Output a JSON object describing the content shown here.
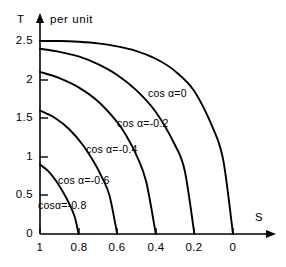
{
  "chart_data": {
    "type": "line",
    "title": "",
    "xlabel": "S",
    "ylabel": "T",
    "ylabel_unit": "per unit",
    "xlim": [
      1,
      0
    ],
    "ylim": [
      0,
      2.5
    ],
    "x_ticks": [
      "1",
      "0.8",
      "0.6",
      "0.4",
      "0.2",
      "0"
    ],
    "x_tick_values": [
      1,
      0.8,
      0.6,
      0.4,
      0.2,
      0
    ],
    "y_ticks": [
      "2.5",
      "2",
      "1.5",
      "1",
      "0.5",
      "0"
    ],
    "y_tick_values": [
      2.5,
      2,
      1.5,
      1,
      0.5,
      0
    ],
    "grid": false,
    "legend_position": "inline-annotations",
    "axis_direction_note": "x axis decreasing left to right",
    "series": [
      {
        "name": "cos α=0",
        "label": "cos α=0",
        "x": [
          1.0,
          0.9,
          0.8,
          0.7,
          0.6,
          0.5,
          0.4,
          0.3,
          0.2,
          0.1,
          0.05,
          0.0
        ],
        "values": [
          2.5,
          2.5,
          2.49,
          2.47,
          2.43,
          2.37,
          2.27,
          2.11,
          1.85,
          1.35,
          0.95,
          0.0
        ]
      },
      {
        "name": "cos α=-0.2",
        "label": "cos α=-0.2",
        "x": [
          1.0,
          0.9,
          0.8,
          0.7,
          0.6,
          0.5,
          0.4,
          0.3,
          0.25,
          0.2
        ],
        "values": [
          2.4,
          2.36,
          2.3,
          2.2,
          2.06,
          1.86,
          1.58,
          1.15,
          0.82,
          0.0
        ]
      },
      {
        "name": "cos α=-0.4",
        "label": "cos α=-0.4",
        "x": [
          1.0,
          0.9,
          0.8,
          0.7,
          0.6,
          0.55,
          0.5,
          0.45,
          0.4
        ],
        "values": [
          2.1,
          2.02,
          1.9,
          1.72,
          1.45,
          1.26,
          1.02,
          0.68,
          0.0
        ]
      },
      {
        "name": "cos α=-0.6",
        "label": "cos α=-0.6",
        "x": [
          1.0,
          0.92,
          0.85,
          0.78,
          0.72,
          0.68,
          0.64,
          0.6
        ],
        "values": [
          1.6,
          1.5,
          1.36,
          1.16,
          0.93,
          0.74,
          0.5,
          0.0
        ]
      },
      {
        "name": "cos α=-0.8",
        "label": "cos α=-0.8",
        "x": [
          1.0,
          0.96,
          0.92,
          0.88,
          0.85,
          0.82,
          0.8
        ],
        "values": [
          0.9,
          0.82,
          0.7,
          0.54,
          0.4,
          0.22,
          0.0
        ]
      }
    ],
    "annotations": [
      {
        "text": "cos α=0",
        "x_px": 148,
        "y_px": 88
      },
      {
        "text": "cos α=-0.2",
        "x_px": 117,
        "y_px": 118
      },
      {
        "text": "cos α=-0.4",
        "x_px": 86,
        "y_px": 144
      },
      {
        "text": "cos α=-0.6",
        "x_px": 58,
        "y_px": 175
      },
      {
        "text": "cosα=-0.8",
        "x_px": 38,
        "y_px": 200
      }
    ]
  },
  "axes": {
    "y_name": "T",
    "y_unit": "per unit",
    "x_name": "S"
  }
}
